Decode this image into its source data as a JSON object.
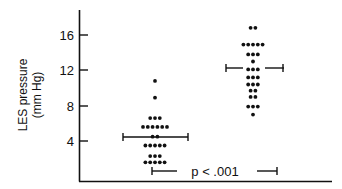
{
  "chart_data": {
    "type": "scatter",
    "subtype": "dot-plot",
    "title": "",
    "xlabel": "",
    "ylabel": "LES pressure (mm Hg)",
    "ylabel_lines": [
      "LES pressure",
      "(mm Hg)"
    ],
    "yticks": [
      4,
      8,
      12,
      16
    ],
    "ylim": [
      0,
      18.5
    ],
    "grid": false,
    "legend": null,
    "groups": [
      {
        "name": "group-1",
        "mean": 4.4,
        "error_bar_low": 0.6,
        "rows": [
          {
            "value": 10.8,
            "count": 1
          },
          {
            "value": 8.9,
            "count": 1
          },
          {
            "value": 6.6,
            "count": 3
          },
          {
            "value": 5.6,
            "count": 6
          },
          {
            "value": 4.5,
            "count": 2
          },
          {
            "value": 3.5,
            "count": 5
          },
          {
            "value": 2.3,
            "count": 3
          },
          {
            "value": 1.6,
            "count": 5
          }
        ]
      },
      {
        "name": "group-2",
        "mean": 12.2,
        "rows": [
          {
            "value": 16.8,
            "count": 2
          },
          {
            "value": 14.9,
            "count": 5
          },
          {
            "value": 13.8,
            "count": 3
          },
          {
            "value": 13.0,
            "count": 1
          },
          {
            "value": 12.1,
            "count": 3
          },
          {
            "value": 11.2,
            "count": 3
          },
          {
            "value": 10.4,
            "count": 3
          },
          {
            "value": 9.7,
            "count": 2
          },
          {
            "value": 9.0,
            "count": 2
          },
          {
            "value": 7.9,
            "count": 3
          },
          {
            "value": 7.0,
            "count": 1
          }
        ]
      }
    ],
    "annotations": [
      {
        "text": "p<.001",
        "type": "significance-bracket"
      }
    ]
  },
  "labels": {
    "ylabel_line1": "LES pressure",
    "ylabel_line2": "(mm Hg)",
    "tick_4": "4",
    "tick_8": "8",
    "tick_12": "12",
    "tick_16": "16",
    "pvalue": "p < .001"
  }
}
